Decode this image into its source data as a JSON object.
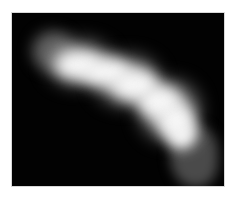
{
  "image": {
    "description": "Grayscale fluorescence-style image of a bright curved elongated blob on black background",
    "colors": {
      "background_outer": "#ffffff",
      "field": "#020202",
      "core": "#f6f6f6",
      "halo": "#5a5a5a"
    }
  }
}
